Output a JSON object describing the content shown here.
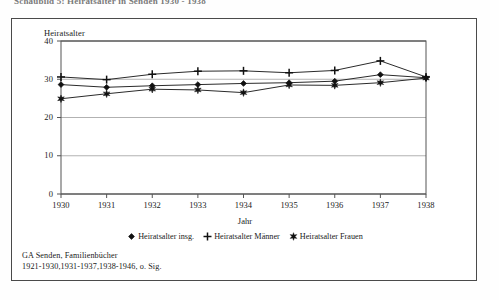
{
  "figure": {
    "top_heading": "Schaubild 5: Heiratsalter in Senden 1930 - 1938",
    "caption_line1": "GA Senden, Familienbücher",
    "caption_line2": "1921-1930,1931-1937,1938-1946, o. Sig.",
    "frame_color": "#4a4a4a",
    "plot_border_color": "#555555",
    "gridline_color": "#a9a9a9",
    "series_line_color": "#2b2b2b",
    "marker_color": "#111111"
  },
  "chart_data": {
    "type": "line",
    "title": "",
    "xlabel": "Jahr",
    "ylabel": "Heiratsalter",
    "categories": [
      "1930",
      "1931",
      "1932",
      "1933",
      "1934",
      "1935",
      "1936",
      "1937",
      "1938"
    ],
    "x": [
      1930,
      1931,
      1932,
      1933,
      1934,
      1935,
      1936,
      1937,
      1938
    ],
    "ylim": [
      0,
      40
    ],
    "yticks": [
      0,
      10,
      20,
      30,
      40
    ],
    "grid": "horizontal",
    "legend_position": "bottom-center",
    "series": [
      {
        "name": "Heiratsalter insg.",
        "marker": "diamond",
        "values": [
          28.6,
          27.9,
          28.3,
          28.6,
          28.9,
          29.1,
          29.5,
          31.2,
          30.4
        ]
      },
      {
        "name": "Heiratsalter Männer",
        "marker": "plus",
        "values": [
          30.6,
          29.9,
          31.3,
          32.1,
          32.2,
          31.7,
          32.3,
          34.8,
          30.6
        ]
      },
      {
        "name": "Heiratsalter Frauen",
        "marker": "star",
        "values": [
          24.9,
          26.2,
          27.4,
          27.2,
          26.5,
          28.5,
          28.4,
          29.1,
          30.3
        ]
      }
    ]
  }
}
